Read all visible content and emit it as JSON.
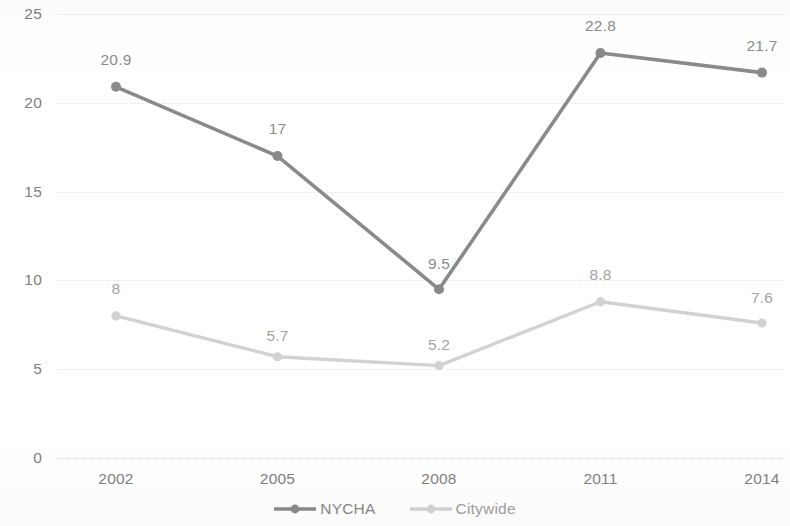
{
  "chart_data": {
    "type": "line",
    "title": "",
    "subtitle": "",
    "xlabel": "",
    "ylabel": "",
    "categories": [
      "2002",
      "2005",
      "2008",
      "2011",
      "2014"
    ],
    "series": [
      {
        "name": "NYCHA",
        "color": "#8a8a8a",
        "values": [
          20.9,
          17,
          9.5,
          22.8,
          21.7
        ],
        "labels": [
          "20.9",
          "17",
          "9.5",
          "22.8",
          "21.7"
        ]
      },
      {
        "name": "Citywide",
        "color": "#d2d2d2",
        "values": [
          8,
          5.7,
          5.2,
          8.8,
          7.6
        ],
        "labels": [
          "8",
          "5.7",
          "5.2",
          "8.8",
          "7.6"
        ]
      }
    ],
    "ylim": [
      0,
      25
    ],
    "yticks": [
      0,
      5,
      10,
      15,
      20,
      25
    ],
    "ytick_labels": [
      "0",
      "5",
      "10",
      "15",
      "20",
      "25"
    ],
    "grid": true,
    "grid_axis": "y",
    "legend_position": "bottom-center",
    "markers": "circle"
  },
  "axes": {
    "y_ticks": [
      "25",
      "20",
      "15",
      "10",
      "5",
      "0"
    ],
    "x_ticks": [
      "2002",
      "2005",
      "2008",
      "2011",
      "2014"
    ]
  },
  "legend": {
    "items": [
      {
        "label": "NYCHA",
        "color": "#8a8a8a"
      },
      {
        "label": "Citywide",
        "color": "#d2d2d2"
      }
    ]
  }
}
